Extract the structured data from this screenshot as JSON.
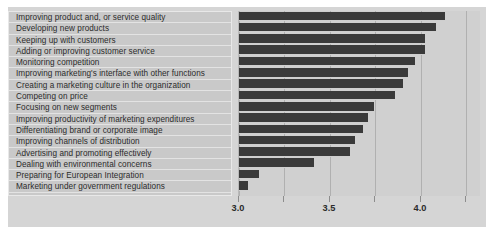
{
  "chart_data": {
    "type": "bar",
    "orientation": "horizontal",
    "title": "",
    "xlabel": "",
    "ylabel": "",
    "xlim": [
      3.0,
      4.33
    ],
    "axis_ticks_major": [
      "3.0",
      "3.5",
      "4.0"
    ],
    "axis_tick_values": [
      3.0,
      3.5,
      4.0
    ],
    "minor_gridlines": [
      3.25,
      3.75,
      4.25
    ],
    "grid": true,
    "legend": "none",
    "categories": [
      "Improving product and, or service quality",
      "Developing new products",
      "Keeping up with customers",
      "Adding or improving customer service",
      "Monitoring competition",
      "Improving marketing's interface with other functions",
      "Creating a marketing culture in the organization",
      "Competing on price",
      "Focusing on new segments",
      "Improving productivity of marketing expenditures",
      "Differentiating brand or corporate image",
      "Improving channels of distribution",
      "Advertising and promoting effectively",
      "Dealing with environmental concerns",
      "Preparing for European Integration",
      "Marketing under government regulations"
    ],
    "values": [
      4.13,
      4.08,
      4.02,
      4.02,
      3.97,
      3.93,
      3.9,
      3.86,
      3.74,
      3.71,
      3.68,
      3.64,
      3.61,
      3.41,
      3.11,
      3.05
    ],
    "bar_color": "#3a3a3a",
    "plot_background": "#d0d0d0",
    "label_panel_background": "#c9c9c9",
    "figure_background": "#d5d5d5"
  }
}
